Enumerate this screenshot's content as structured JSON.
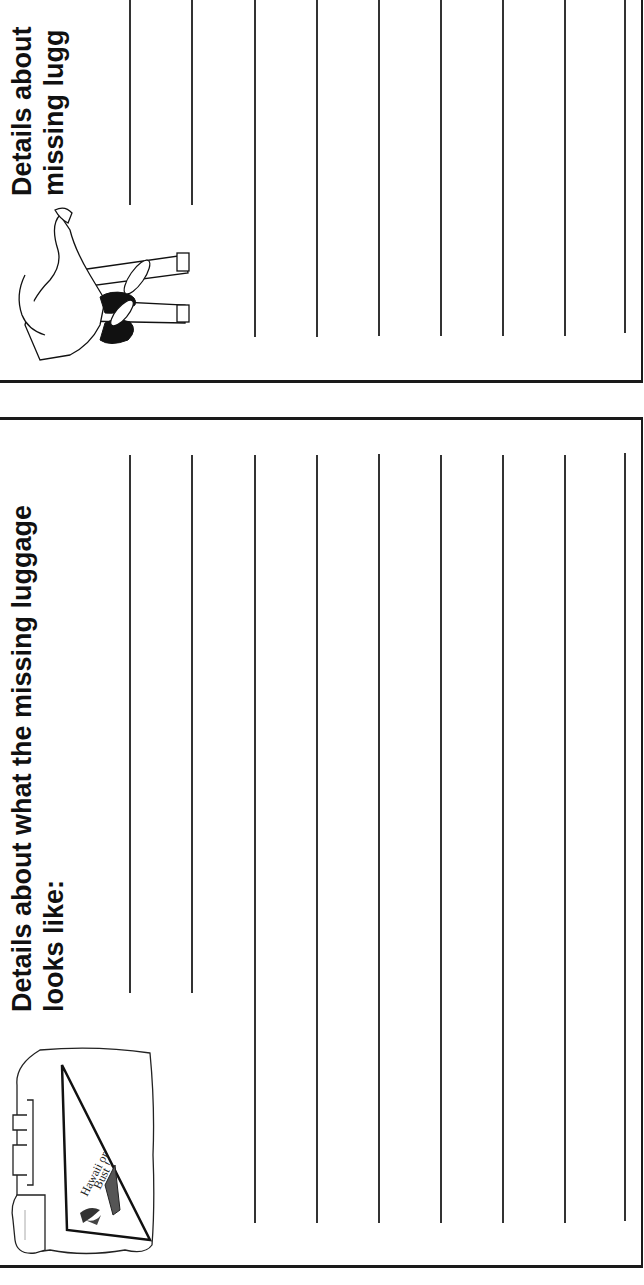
{
  "worksheet": {
    "orientation": "rotated-90-ccw",
    "top_panel": {
      "heading_line1": "Details about",
      "heading_line2": "missing lugg",
      "illustration": "person-sitting-icon"
    },
    "bottom_panel": {
      "heading_line1": "Details about what the missing luggage",
      "heading_line2": "looks like:",
      "illustration": "suitcase-icon",
      "pennant_text_line1": "Hawaii or",
      "pennant_text_line2": "Bust !"
    },
    "writing_lines_count": 9,
    "colors": {
      "ink": "#1a1a1a",
      "paper": "#ffffff",
      "line": "#333333"
    }
  }
}
